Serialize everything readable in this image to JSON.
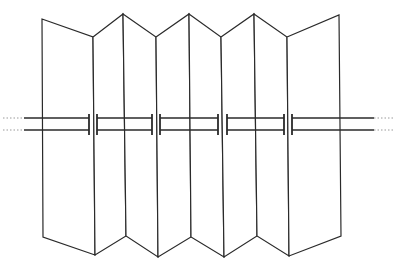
{
  "diagram": {
    "title": "",
    "stroke_color": "#2a2a2a",
    "background": "#ffffff",
    "top_vertices": [
      [
        42,
        19
      ],
      [
        93,
        37
      ],
      [
        123,
        14
      ],
      [
        156,
        37
      ],
      [
        189,
        14
      ],
      [
        221,
        37
      ],
      [
        254,
        14
      ],
      [
        287,
        37
      ],
      [
        339,
        15
      ]
    ],
    "bottom_vertices": [
      [
        43,
        237
      ],
      [
        95,
        255
      ],
      [
        126,
        236
      ],
      [
        158,
        257
      ],
      [
        191,
        237
      ],
      [
        224,
        257
      ],
      [
        257,
        236
      ],
      [
        289,
        256
      ],
      [
        341,
        236
      ]
    ],
    "rod": {
      "upper_y": 118,
      "lower_y": 130,
      "left_continuation": [
        3,
        24
      ],
      "right_continuation": [
        374,
        395
      ],
      "segments": [
        [
          24,
          89
        ],
        [
          97,
          152
        ],
        [
          160,
          218
        ],
        [
          227,
          284
        ],
        [
          292,
          374
        ]
      ],
      "end_caps_x": [
        89,
        97,
        152,
        160,
        218,
        227,
        284,
        292
      ]
    },
    "panel_count": 8,
    "labels": []
  }
}
